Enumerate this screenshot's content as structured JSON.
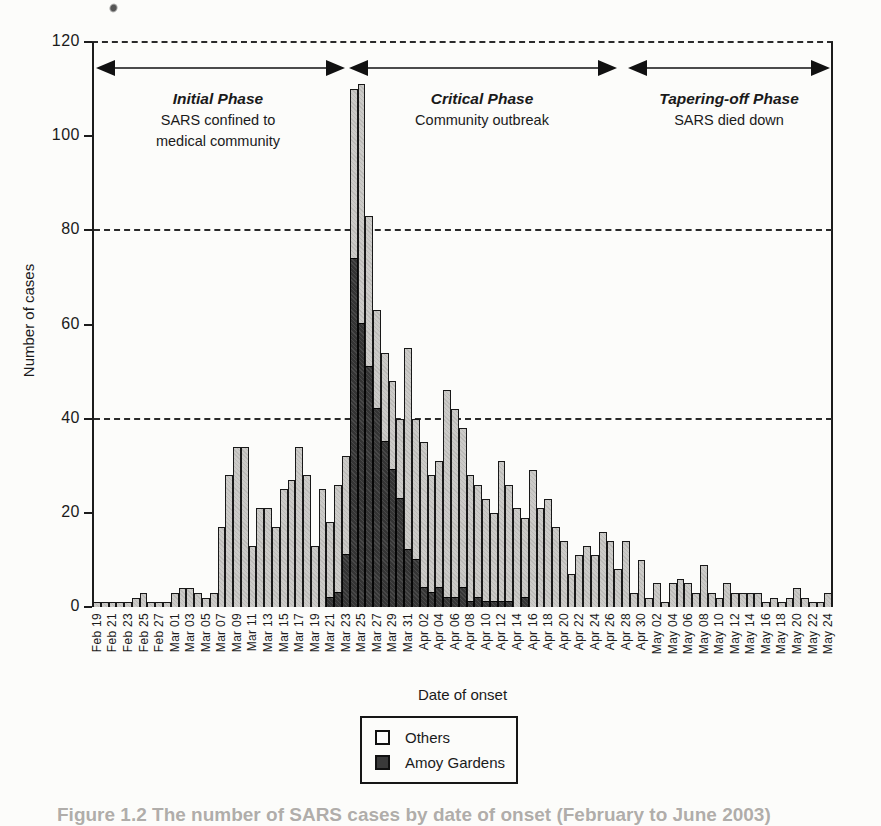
{
  "figure": {
    "yaxis_title": "Number of cases",
    "xaxis_title": "Date of onset",
    "phases": [
      {
        "title": "Initial Phase",
        "subtitle_lines": [
          "SARS confined to",
          "medical community"
        ]
      },
      {
        "title": "Critical Phase",
        "subtitle_lines": [
          "Community outbreak"
        ]
      },
      {
        "title": "Tapering-off Phase",
        "subtitle_lines": [
          "SARS died down"
        ]
      }
    ],
    "legend": [
      {
        "label": "Others",
        "color": "#c9c8c5"
      },
      {
        "label": "Amoy Gardens",
        "color": "#3a3a3a"
      }
    ],
    "caption_fragment": "Figure 1.2   The number of SARS cases by date of onset (February to June 2003)",
    "colors": {
      "others_fill": "#c9c8c5",
      "amoy_fill": "#3a3a3a",
      "outline": "#181818"
    }
  },
  "chart_data": {
    "type": "bar",
    "stacked": true,
    "title": "",
    "xlabel": "Date of onset",
    "ylabel": "Number of cases",
    "ylim": [
      0,
      120
    ],
    "yticks": [
      0,
      20,
      40,
      60,
      80,
      100,
      120
    ],
    "dashed_gridlines": [
      40,
      80,
      120
    ],
    "label_every": 2,
    "legend_position": "bottom",
    "categories": [
      "Feb 19",
      "Feb 20",
      "Feb 21",
      "Feb 22",
      "Feb 23",
      "Feb 24",
      "Feb 25",
      "Feb 26",
      "Feb 27",
      "Feb 28",
      "Mar 01",
      "Mar 02",
      "Mar 03",
      "Mar 04",
      "Mar 05",
      "Mar 06",
      "Mar 07",
      "Mar 08",
      "Mar 09",
      "Mar 10",
      "Mar 11",
      "Mar 12",
      "Mar 13",
      "Mar 14",
      "Mar 15",
      "Mar 16",
      "Mar 17",
      "Mar 18",
      "Mar 19",
      "Mar 20",
      "Mar 21",
      "Mar 22",
      "Mar 23",
      "Mar 24",
      "Mar 25",
      "Mar 26",
      "Mar 27",
      "Mar 28",
      "Mar 29",
      "Mar 30",
      "Mar 31",
      "Apr 01",
      "Apr 02",
      "Apr 03",
      "Apr 04",
      "Apr 05",
      "Apr 06",
      "Apr 07",
      "Apr 08",
      "Apr 09",
      "Apr 10",
      "Apr 11",
      "Apr 12",
      "Apr 13",
      "Apr 14",
      "Apr 15",
      "Apr 16",
      "Apr 17",
      "Apr 18",
      "Apr 19",
      "Apr 20",
      "Apr 21",
      "Apr 22",
      "Apr 23",
      "Apr 24",
      "Apr 25",
      "Apr 26",
      "Apr 27",
      "Apr 28",
      "Apr 29",
      "Apr 30",
      "May 01",
      "May 02",
      "May 03",
      "May 04",
      "May 05",
      "May 06",
      "May 07",
      "May 08",
      "May 09",
      "May 10",
      "May 11",
      "May 12",
      "May 13",
      "May 14",
      "May 15",
      "May 16",
      "May 17",
      "May 18",
      "May 19",
      "May 20",
      "May 21",
      "May 22",
      "May 23",
      "May 24"
    ],
    "series": [
      {
        "name": "Amoy Gardens",
        "values": [
          0,
          0,
          0,
          0,
          0,
          0,
          0,
          0,
          0,
          0,
          0,
          0,
          0,
          0,
          0,
          0,
          0,
          0,
          0,
          0,
          0,
          0,
          0,
          0,
          0,
          0,
          0,
          0,
          0,
          0,
          2,
          3,
          11,
          74,
          60,
          51,
          42,
          35,
          29,
          23,
          12,
          10,
          4,
          3,
          4,
          2,
          2,
          4,
          1,
          2,
          1,
          1,
          1,
          1,
          0,
          2,
          0,
          0,
          0,
          0,
          0,
          0,
          0,
          0,
          0,
          0,
          0,
          0,
          0,
          0,
          0,
          0,
          0,
          0,
          0,
          0,
          0,
          0,
          0,
          0,
          0,
          0,
          0,
          0,
          0,
          0,
          0,
          0,
          0,
          0,
          0,
          0,
          0,
          0,
          0
        ]
      },
      {
        "name": "Others",
        "values": [
          1,
          1,
          1,
          1,
          1,
          2,
          3,
          1,
          1,
          1,
          3,
          4,
          4,
          3,
          2,
          3,
          17,
          28,
          34,
          34,
          13,
          21,
          21,
          17,
          25,
          27,
          34,
          28,
          13,
          25,
          16,
          23,
          21,
          36,
          51,
          32,
          21,
          19,
          19,
          17,
          43,
          30,
          31,
          25,
          27,
          44,
          40,
          34,
          27,
          24,
          22,
          19,
          30,
          25,
          21,
          17,
          29,
          21,
          23,
          17,
          14,
          7,
          11,
          13,
          11,
          16,
          14,
          8,
          14,
          3,
          10,
          2,
          5,
          1,
          5,
          6,
          5,
          3,
          9,
          3,
          2,
          5,
          3,
          3,
          3,
          3,
          1,
          2,
          1,
          2,
          4,
          2,
          1,
          1,
          3
        ]
      }
    ],
    "phase_spans_categories": [
      {
        "phase": "Initial Phase",
        "from": "Feb 19",
        "to": "Mar 23"
      },
      {
        "phase": "Critical Phase",
        "from": "Mar 23",
        "to": "Apr 26"
      },
      {
        "phase": "Tapering-off Phase",
        "from": "Apr 28",
        "to": "May 24"
      }
    ]
  }
}
